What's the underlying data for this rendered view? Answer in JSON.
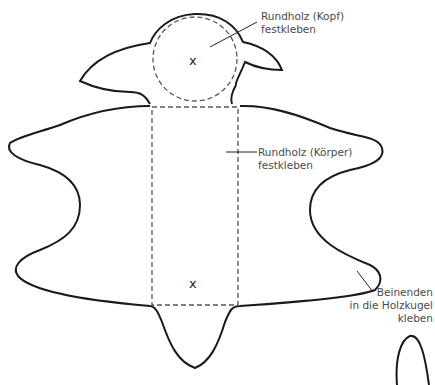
{
  "diagram": {
    "type": "craft-template",
    "colors": {
      "outline": "#1a1a1a",
      "dashed": "#555555",
      "text": "#4a4a4a",
      "background": "#ffffff"
    },
    "markers": {
      "head_center": "x",
      "body_bottom": "x"
    },
    "labels": {
      "head": {
        "line1": "Rundholz (Kopf)",
        "line2": "festkleben"
      },
      "body": {
        "line1": "Rundholz (Körper)",
        "line2": "festkleben"
      },
      "legs": {
        "line1": "Beinenden",
        "line2": "in die Holzkugel",
        "line3": "kleben"
      }
    }
  }
}
